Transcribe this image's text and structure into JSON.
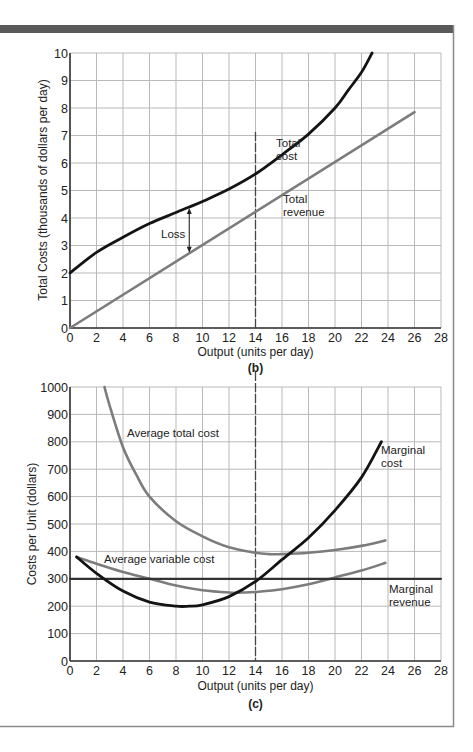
{
  "colors": {
    "header_bar": "#5a5a5a",
    "frame": "#8a8a8a",
    "grid": "#b9b9b9",
    "axis": "#333333",
    "dark_curve": "#141414",
    "grey_curve": "#7c7c7c",
    "dashed": "#444444"
  },
  "chart_data": [
    {
      "type": "line",
      "panel": "(b)",
      "title": "",
      "xlabel": "Output (units per day)",
      "ylabel": "Total Costs (thousands of dollars per day)",
      "xlim": [
        0,
        28
      ],
      "ylim": [
        0,
        10
      ],
      "x_ticks": [
        0,
        2,
        4,
        6,
        8,
        10,
        12,
        14,
        16,
        18,
        20,
        22,
        24,
        26,
        28
      ],
      "y_ticks": [
        0,
        1,
        2,
        3,
        4,
        5,
        6,
        7,
        8,
        9,
        10
      ],
      "grid": true,
      "series": [
        {
          "name": "Total cost",
          "color": "#141414",
          "x": [
            0,
            2,
            4,
            6,
            8,
            9,
            10,
            12,
            14,
            16,
            18,
            20,
            21,
            22,
            22.8
          ],
          "y": [
            2.0,
            2.75,
            3.3,
            3.8,
            4.2,
            4.4,
            4.6,
            5.05,
            5.6,
            6.3,
            7.05,
            8.0,
            8.65,
            9.3,
            10.0
          ]
        },
        {
          "name": "Total revenue",
          "color": "#7c7c7c",
          "x": [
            0,
            26
          ],
          "y": [
            0,
            7.85
          ]
        }
      ],
      "annotations": [
        {
          "text": "Total cost",
          "x": 14,
          "y": 6.6
        },
        {
          "text": "Total revenue",
          "x": 16,
          "y": 4.6
        },
        {
          "text": "Loss",
          "x": 7,
          "y": 3.5,
          "arrow_x": 9,
          "arrow_from": 2.7,
          "arrow_to": 4.4
        }
      ],
      "reference_lines": [
        {
          "type": "vertical",
          "x": 14,
          "style": "dashed"
        }
      ]
    },
    {
      "type": "line",
      "panel": "(c)",
      "title": "",
      "xlabel": "Output (units per day)",
      "ylabel": "Costs per Unit (dollars)",
      "xlim": [
        0,
        28
      ],
      "ylim": [
        0,
        1000
      ],
      "x_ticks": [
        0,
        2,
        4,
        6,
        8,
        10,
        12,
        14,
        16,
        18,
        20,
        22,
        24,
        26,
        28
      ],
      "y_ticks": [
        0,
        100,
        200,
        300,
        400,
        500,
        600,
        700,
        800,
        900,
        1000
      ],
      "grid": true,
      "series": [
        {
          "name": "Average total cost",
          "color": "#7c7c7c",
          "x": [
            2.6,
            3,
            4,
            5,
            6,
            8,
            10,
            12,
            14,
            15,
            16,
            18,
            20,
            22,
            23.8
          ],
          "y": [
            1000,
            930,
            780,
            680,
            600,
            510,
            455,
            415,
            395,
            390,
            390,
            395,
            405,
            420,
            440
          ]
        },
        {
          "name": "Average variable cost",
          "color": "#7c7c7c",
          "x": [
            0.5,
            2,
            4,
            6,
            8,
            10,
            12,
            13,
            14,
            16,
            18,
            20,
            22,
            23.8
          ],
          "y": [
            380,
            355,
            325,
            300,
            275,
            258,
            250,
            250,
            252,
            262,
            280,
            305,
            330,
            358
          ]
        },
        {
          "name": "Marginal cost",
          "color": "#141414",
          "x": [
            0.5,
            2,
            4,
            6,
            8,
            9,
            10,
            12,
            14,
            16,
            18,
            20,
            22,
            23.5
          ],
          "y": [
            380,
            320,
            255,
            215,
            200,
            200,
            205,
            235,
            290,
            370,
            450,
            550,
            670,
            800
          ]
        },
        {
          "name": "Marginal revenue",
          "color": "#333333",
          "x": [
            0,
            28
          ],
          "y": [
            300,
            300
          ]
        }
      ],
      "annotations": [
        {
          "text": "Average total cost",
          "x": 4.2,
          "y": 835
        },
        {
          "text": "Average variable cost",
          "x": 1.4,
          "y": 385
        },
        {
          "text": "Marginal cost",
          "x": 24.2,
          "y": 760
        },
        {
          "text": "Marginal revenue",
          "x": 23.9,
          "y": 255
        }
      ],
      "reference_lines": [
        {
          "type": "vertical",
          "x": 14,
          "style": "dashed"
        }
      ]
    }
  ],
  "top": {
    "ylabel": "Total Costs (thousands of dollars per day)",
    "xlabel": "Output (units per day)",
    "panel": "(b)",
    "ann_total_cost_1": "Total",
    "ann_total_cost_2": "cost",
    "ann_total_rev_1": "Total",
    "ann_total_rev_2": "revenue",
    "ann_loss": "Loss"
  },
  "bottom": {
    "ylabel": "Costs per Unit (dollars)",
    "xlabel": "Output (units per day)",
    "panel": "(c)",
    "ann_atc": "Average total cost",
    "ann_avc": "Average variable cost",
    "ann_mc_1": "Marginal",
    "ann_mc_2": "cost",
    "ann_mr_1": "Marginal",
    "ann_mr_2": "revenue"
  }
}
